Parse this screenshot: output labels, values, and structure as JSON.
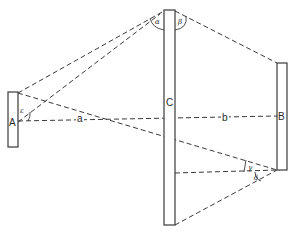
{
  "diagram": {
    "title": "",
    "posts": [
      {
        "id": "A",
        "label": "A"
      },
      {
        "id": "C",
        "label": "C"
      },
      {
        "id": "B",
        "label": "B"
      }
    ],
    "distances": [
      {
        "id": "a",
        "label": "a"
      },
      {
        "id": "b",
        "label": "b"
      }
    ],
    "angles": [
      {
        "id": "alpha",
        "label": "α"
      },
      {
        "id": "beta",
        "label": "β"
      },
      {
        "id": "gamma",
        "label": "γ"
      },
      {
        "id": "delta",
        "label": "δ"
      },
      {
        "id": "epsilon",
        "label": "ε"
      }
    ],
    "colors": {
      "line": "#3a3a3a",
      "background": "#ffffff"
    }
  }
}
